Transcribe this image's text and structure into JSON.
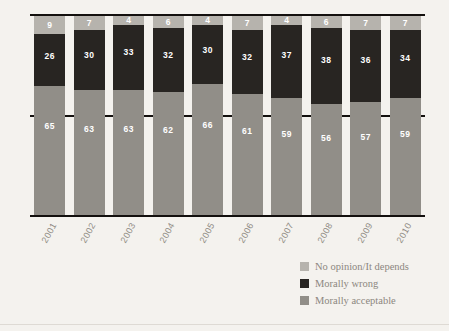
{
  "chart_data": {
    "type": "bar",
    "subtype": "stacked-100-percent",
    "title": "",
    "xlabel": "",
    "ylabel": "",
    "ylim": [
      0,
      100
    ],
    "grid": false,
    "legend_position": "bottom-right",
    "categories": [
      "2001",
      "2002",
      "2003",
      "2004",
      "2005",
      "2006",
      "2007",
      "2008",
      "2009",
      "2010"
    ],
    "ytick_labels": [
      "100%",
      "50%"
    ],
    "series": [
      {
        "name": "No opinion/It depends",
        "color": "#b6b3ad",
        "values": [
          9,
          7,
          4,
          6,
          4,
          7,
          4,
          6,
          7,
          7
        ]
      },
      {
        "name": "Morally wrong",
        "color": "#282522",
        "values": [
          26,
          30,
          33,
          32,
          30,
          32,
          37,
          38,
          36,
          34
        ]
      },
      {
        "name": "Morally acceptable",
        "color": "#918e88",
        "values": [
          65,
          63,
          63,
          62,
          66,
          61,
          59,
          56,
          57,
          59
        ]
      }
    ]
  },
  "axis": {
    "y_top_label": "100%",
    "y_mid_label": "50%"
  },
  "legend": {
    "items": [
      {
        "label": "No opinion/It depends",
        "color": "#b6b3ad"
      },
      {
        "label": "Morally wrong",
        "color": "#282522"
      },
      {
        "label": "Morally acceptable",
        "color": "#918e88"
      }
    ]
  },
  "colors": {
    "background": "#f4f2ee",
    "axis_line": "#13100e",
    "tick_text": "#8f8a83",
    "value_text": "#ffffff"
  }
}
